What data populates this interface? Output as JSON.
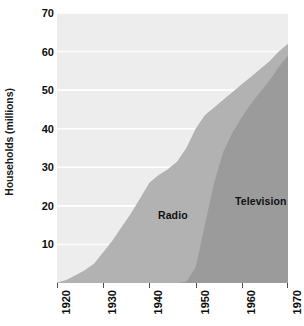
{
  "chart_data": {
    "type": "area",
    "title": "",
    "subtitle": "",
    "xlabel": "",
    "ylabel": "Households (millions)",
    "xlim": [
      1920,
      1970
    ],
    "ylim": [
      0,
      70
    ],
    "grid": true,
    "grid_axis": "y",
    "legend": "inline-labels",
    "xticks": [
      1920,
      1930,
      1940,
      1950,
      1960,
      1970
    ],
    "xtick_labels": [
      "1920",
      "1930",
      "1940",
      "1950",
      "1960",
      "1970"
    ],
    "yticks": [
      10,
      20,
      30,
      40,
      50,
      60,
      70
    ],
    "ytick_labels": [
      "10",
      "20",
      "30",
      "40",
      "50",
      "60",
      "70"
    ],
    "x": [
      1920,
      1922,
      1924,
      1926,
      1928,
      1930,
      1932,
      1934,
      1936,
      1938,
      1940,
      1942,
      1944,
      1946,
      1948,
      1950,
      1952,
      1954,
      1956,
      1958,
      1960,
      1962,
      1964,
      1966,
      1968,
      1970
    ],
    "series": [
      {
        "name": "Radio",
        "label": "Radio",
        "color": "#b2b2b2",
        "values": [
          0.1,
          0.8,
          2.0,
          3.3,
          5.0,
          8.0,
          11.0,
          14.5,
          18.0,
          22.0,
          26.0,
          28.0,
          29.5,
          31.5,
          35.0,
          40.0,
          43.5,
          45.5,
          47.5,
          49.5,
          51.5,
          53.5,
          55.5,
          57.5,
          60.0,
          62.0
        ]
      },
      {
        "name": "Television",
        "label": "Television",
        "color": "#9b9b9b",
        "values": [
          0,
          0,
          0,
          0,
          0,
          0,
          0,
          0,
          0,
          0,
          0,
          0,
          0,
          0,
          0.3,
          4.0,
          15.0,
          26.0,
          34.0,
          39.0,
          43.0,
          46.5,
          49.5,
          52.5,
          56.0,
          59.0
        ]
      }
    ],
    "colors": {
      "plot_background": "#ededed",
      "gridline": "#ffffff",
      "radio_fill": "#b2b2b2",
      "television_fill": "#9b9b9b",
      "text": "#0d0d0d",
      "page_background": "#ffffff"
    }
  }
}
